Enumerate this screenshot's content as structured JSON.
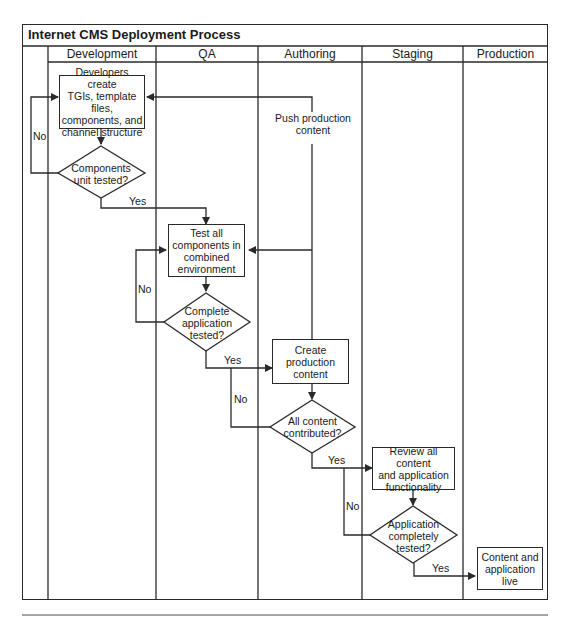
{
  "title": "Internet CMS Deployment Process",
  "lanes": [
    "Development",
    "QA",
    "Authoring",
    "Staging",
    "Production"
  ],
  "nodes": {
    "dev_create": "Developers create TGIs, template files, components, and channel structure",
    "dev_create_lines": [
      "Developers create",
      "TGIs, template files,",
      "components, and",
      "channel structure"
    ],
    "dev_decision_lines": [
      "Components",
      "unit tested?"
    ],
    "qa_test_lines": [
      "Test all",
      "components in",
      "combined",
      "environment"
    ],
    "qa_decision_lines": [
      "Complete",
      "application",
      "tested?"
    ],
    "auth_create_lines": [
      "Create",
      "production",
      "content"
    ],
    "auth_decision_lines": [
      "All content",
      "contributed?"
    ],
    "stage_review_lines": [
      "Review all content",
      "and application",
      "functionality"
    ],
    "stage_decision_lines": [
      "Application",
      "completely",
      "tested?"
    ],
    "prod_live_lines": [
      "Content and",
      "application",
      "live"
    ]
  },
  "edge_labels": {
    "no_dev": "No",
    "yes_dev": "Yes",
    "no_qa": "No",
    "yes_qa": "Yes",
    "no_auth": "No",
    "yes_auth": "Yes",
    "no_stage": "No",
    "yes_stage": "Yes",
    "push_lines": [
      "Push production",
      "content"
    ]
  },
  "colors": {
    "line": "#2a2a2a",
    "background": "#ffffff"
  }
}
